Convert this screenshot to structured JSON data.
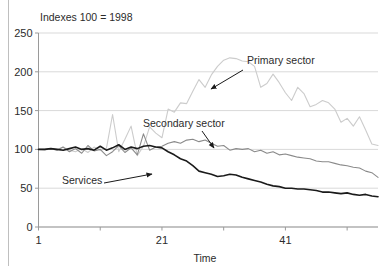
{
  "chart_data": {
    "type": "line",
    "title": "Indexes 100 = 1998",
    "xlabel": "Time",
    "ylabel": "",
    "xlim": [
      1,
      56
    ],
    "ylim": [
      0,
      250
    ],
    "xticks": [
      1,
      21,
      41
    ],
    "xtick_labels": [
      "1",
      "21",
      "41"
    ],
    "yticks": [
      0,
      50,
      100,
      150,
      200,
      250
    ],
    "ytick_labels": [
      "0",
      "50",
      "100",
      "150",
      "200",
      "250"
    ],
    "grid": "horizontal",
    "legend": "none",
    "x": [
      1,
      2,
      3,
      4,
      5,
      6,
      7,
      8,
      9,
      10,
      11,
      12,
      13,
      14,
      15,
      16,
      17,
      18,
      19,
      20,
      21,
      22,
      23,
      24,
      25,
      26,
      27,
      28,
      29,
      30,
      31,
      32,
      33,
      34,
      35,
      36,
      37,
      38,
      39,
      40,
      41,
      42,
      43,
      44,
      45,
      46,
      47,
      48,
      49,
      50,
      51,
      52,
      53,
      54,
      55,
      56
    ],
    "series": [
      {
        "name": "Primary sector",
        "color": "#cccccc",
        "values": [
          100,
          99,
          101,
          100,
          103,
          99,
          97,
          101,
          96,
          103,
          99,
          101,
          145,
          97,
          113,
          130,
          92,
          104,
          129,
          121,
          115,
          152,
          148,
          160,
          159,
          175,
          190,
          180,
          196,
          207,
          215,
          218,
          217,
          214,
          213,
          207,
          180,
          185,
          197,
          186,
          173,
          163,
          180,
          172,
          155,
          158,
          163,
          160,
          152,
          135,
          140,
          130,
          142,
          125,
          107,
          105
        ]
      },
      {
        "name": "Secondary sector",
        "color": "#8a8a8a",
        "values": [
          100,
          100,
          101,
          99,
          103,
          97,
          101,
          95,
          105,
          98,
          100,
          92,
          97,
          105,
          96,
          102,
          93,
          120,
          99,
          103,
          104,
          108,
          110,
          108,
          112,
          113,
          110,
          112,
          108,
          104,
          105,
          99,
          101,
          100,
          101,
          97,
          99,
          95,
          97,
          93,
          94,
          92,
          90,
          89,
          88,
          85,
          84,
          84,
          82,
          80,
          79,
          77,
          76,
          72,
          70,
          64
        ]
      },
      {
        "name": "Services",
        "color": "#1a1a1a",
        "values": [
          100,
          100,
          101,
          100,
          99,
          101,
          103,
          100,
          101,
          99,
          104,
          99,
          102,
          106,
          100,
          103,
          101,
          104,
          105,
          103,
          102,
          97,
          93,
          88,
          85,
          79,
          72,
          70,
          68,
          65,
          66,
          68,
          67,
          64,
          62,
          60,
          58,
          55,
          53,
          52,
          50,
          50,
          49,
          49,
          48,
          47,
          45,
          45,
          44,
          43,
          44,
          42,
          41,
          42,
          40,
          39
        ]
      }
    ],
    "annotations": [
      {
        "label": "Primary sector",
        "label_x": 247,
        "label_y": 64,
        "arrow_from_x": 243,
        "arrow_from_y": 70,
        "arrow_to_x": 211,
        "arrow_to_y": 89
      },
      {
        "label": "Secondary sector",
        "label_x": 143,
        "label_y": 127,
        "arrow_from_x": 202,
        "arrow_from_y": 131,
        "arrow_to_x": 214,
        "arrow_to_y": 148
      },
      {
        "label": "Services",
        "label_x": 62,
        "label_y": 184,
        "arrow_from_x": 104,
        "arrow_from_y": 183,
        "arrow_to_x": 152,
        "arrow_to_y": 174
      }
    ]
  },
  "frame": {
    "page_border": "#bfbfbf",
    "gridline_color": "#d9d9d9",
    "axis_color": "#9a9a9a"
  }
}
